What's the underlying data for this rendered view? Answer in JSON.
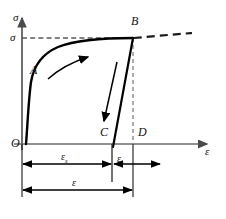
{
  "caption": {
    "text": "",
    "visible_faint": true
  },
  "figure": {
    "title": "",
    "type": "stress-strain-diagram",
    "axes": {
      "y_label": "σ",
      "x_label": "ε",
      "y_label_name": "sigma",
      "x_label_name": "epsilon"
    },
    "stress_level_label": "σ",
    "points": [
      {
        "id": "O",
        "label": "O",
        "x": 14,
        "y": 144
      },
      {
        "id": "A",
        "label": "A",
        "x": 30,
        "y": 70
      },
      {
        "id": "B",
        "label": "B",
        "x": 134,
        "y": 25
      },
      {
        "id": "C",
        "label": "C",
        "x": 105,
        "y": 132
      },
      {
        "id": "D",
        "label": "D",
        "x": 140,
        "y": 132
      }
    ],
    "dimensions": [
      {
        "id": "eps-s",
        "base": "ε",
        "sub": "s",
        "from_x": 22,
        "to_x": 112,
        "y": 163
      },
      {
        "id": "eps-r",
        "base": "ε",
        "sub": "r",
        "from_x": 112,
        "to_x": 140,
        "y": 163
      },
      {
        "id": "eps-total",
        "base": "ε",
        "sub": "",
        "from_x": 22,
        "to_x": 140,
        "y": 190
      }
    ],
    "annotations": [
      {
        "id": "loading-arrow",
        "meaning": "loading direction along curve"
      },
      {
        "id": "unloading-arrow",
        "meaning": "unloading direction down steep line"
      },
      {
        "id": "dashed-stress-line",
        "meaning": "horizontal dashed line at stress sigma to point B"
      },
      {
        "id": "dashed-strain-line",
        "meaning": "vertical dashed line from B down to D"
      },
      {
        "id": "dashed-curve-extension",
        "meaning": "dashed continuation of curve beyond B"
      }
    ],
    "colors": {
      "curve": "#000000",
      "axis": "#555555",
      "dashed": "#666666",
      "label": "#111111",
      "background": "#ffffff"
    }
  }
}
